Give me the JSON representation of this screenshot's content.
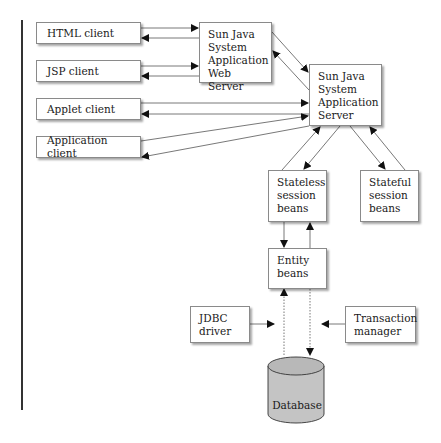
{
  "diagram": {
    "type": "architecture",
    "nodes": {
      "html_client": "HTML client",
      "jsp_client": "JSP client",
      "applet_client": "Applet client",
      "application_client": "Application client",
      "web_server": [
        "Sun Java",
        "System",
        "Application",
        "Web Server"
      ],
      "app_server": [
        "Sun Java",
        "System",
        "Application",
        "Server"
      ],
      "stateless": [
        "Stateless",
        "session",
        "beans"
      ],
      "stateful": [
        "Stateful",
        "session",
        "beans"
      ],
      "entity": [
        "Entity",
        "beans"
      ],
      "jdbc": [
        "JDBC",
        "driver"
      ],
      "transaction": [
        "Transaction",
        "manager"
      ],
      "database": "Database"
    },
    "edges": [
      {
        "from": "HTML client",
        "to": "Sun Java System Application Web Server",
        "bidirectional": true
      },
      {
        "from": "JSP client",
        "to": "Sun Java System Application Web Server",
        "bidirectional": true
      },
      {
        "from": "Sun Java System Application Web Server",
        "to": "Sun Java System Application Server",
        "bidirectional": true
      },
      {
        "from": "Applet client",
        "to": "Sun Java System Application Server",
        "bidirectional": true
      },
      {
        "from": "Application client",
        "to": "Sun Java System Application Server",
        "bidirectional": true
      },
      {
        "from": "Sun Java System Application Server",
        "to": "Stateless session beans",
        "bidirectional": true
      },
      {
        "from": "Sun Java System Application Server",
        "to": "Stateful session beans",
        "bidirectional": true
      },
      {
        "from": "Stateless session beans",
        "to": "Entity beans",
        "bidirectional": true
      },
      {
        "from": "Entity beans",
        "to": "Database",
        "bidirectional": true,
        "style": "dotted"
      },
      {
        "from": "JDBC driver",
        "to": "Entity-Database link",
        "style": "solid"
      },
      {
        "from": "Transaction manager",
        "to": "Entity-Database link",
        "style": "solid"
      }
    ]
  }
}
